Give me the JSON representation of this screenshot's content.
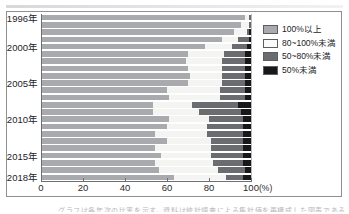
{
  "figure": {
    "unit_label": "(%)",
    "caption_fragment": "グラフは各年次の比率を示す。資料は統計調査による集計値を再構成した図表である"
  },
  "legend": {
    "items": [
      {
        "label": "100%以上",
        "color": "#a9aaad"
      },
      {
        "label": "80~100%未満",
        "color": "#f4f4f3"
      },
      {
        "label": "50~80%未満",
        "color": "#6a6c70"
      },
      {
        "label": "50%未満",
        "color": "#18181a"
      }
    ]
  },
  "chart_data": {
    "type": "bar",
    "orientation": "horizontal",
    "stacked": true,
    "normalized_percent": true,
    "title": "",
    "xlabel": "(%)",
    "ylabel": "",
    "xlim": [
      0,
      100
    ],
    "xticks": [
      0,
      20,
      40,
      60,
      80,
      100
    ],
    "grid": false,
    "legend_position": "right",
    "categories": [
      "1996年",
      "1997年",
      "1998年",
      "1999年",
      "2000年",
      "2001年",
      "2002年",
      "2003年",
      "2004年",
      "2005年",
      "2006年",
      "2007年",
      "2008年",
      "2009年",
      "2010年",
      "2011年",
      "2012年",
      "2013年",
      "2014年",
      "2015年",
      "2016年",
      "2017年",
      "2018年"
    ],
    "visible_tick_labels": [
      "1996年",
      "2000年",
      "2005年",
      "2010年",
      "2015年",
      "2018年"
    ],
    "series": [
      {
        "name": "100%以上",
        "values": [
          97,
          95,
          92,
          86,
          78,
          70,
          69,
          70,
          71,
          70,
          60,
          61,
          53,
          53,
          61,
          60,
          54,
          60,
          54,
          57,
          54,
          56,
          63
        ]
      },
      {
        "name": "80~100%未満",
        "values": [
          2,
          4,
          6,
          8,
          13,
          17,
          17,
          16,
          15,
          16,
          25,
          24,
          19,
          22,
          19,
          19,
          25,
          21,
          27,
          24,
          28,
          28,
          25
        ]
      },
      {
        "name": "50~80%未満",
        "values": [
          1,
          1,
          1,
          5,
          7,
          10,
          11,
          11,
          11,
          11,
          12,
          12,
          22,
          20,
          16,
          17,
          17,
          15,
          15,
          15,
          14,
          13,
          8
        ]
      },
      {
        "name": "50%未満",
        "values": [
          0,
          0,
          1,
          1,
          2,
          3,
          3,
          3,
          3,
          3,
          3,
          3,
          6,
          5,
          4,
          4,
          4,
          4,
          4,
          4,
          4,
          3,
          4
        ]
      }
    ]
  }
}
